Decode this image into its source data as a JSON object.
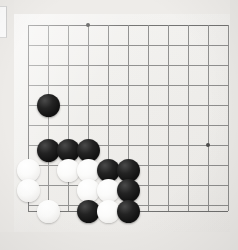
{
  "scene": {
    "title": "Go board corner",
    "subject": "go-game-position",
    "board_color": "#efeeeb",
    "line_color": "#8d8d8c",
    "black_stone_color": "#121212",
    "white_stone_color": "#fbfbfa",
    "background_color": "#eceae6"
  },
  "board": {
    "grid_origin_x": 28,
    "grid_origin_y": 25,
    "grid_spacing": 20,
    "columns": 11,
    "rows": 10,
    "left_edge_x": 28,
    "bottom_edge_y": 211,
    "stone_radius": 11.5,
    "star_points": [
      {
        "x": 88,
        "y": 25
      },
      {
        "x": 208,
        "y": 145
      }
    ],
    "vertical_lines_x": [
      28,
      48,
      68,
      88,
      108,
      128,
      148,
      168,
      188,
      208,
      228
    ],
    "horizontal_lines_y": [
      25,
      45,
      65,
      85,
      105,
      125,
      145,
      165,
      185,
      205,
      211
    ]
  },
  "stones": [
    {
      "color": "black",
      "x": 48,
      "y": 105
    },
    {
      "color": "black",
      "x": 48,
      "y": 150
    },
    {
      "color": "black",
      "x": 68,
      "y": 150
    },
    {
      "color": "black",
      "x": 88,
      "y": 150
    },
    {
      "color": "white",
      "x": 28,
      "y": 170
    },
    {
      "color": "white",
      "x": 68,
      "y": 170
    },
    {
      "color": "white",
      "x": 88,
      "y": 170
    },
    {
      "color": "black",
      "x": 108,
      "y": 170
    },
    {
      "color": "black",
      "x": 128,
      "y": 170
    },
    {
      "color": "white",
      "x": 28,
      "y": 190
    },
    {
      "color": "white",
      "x": 88,
      "y": 190
    },
    {
      "color": "white",
      "x": 108,
      "y": 190
    },
    {
      "color": "black",
      "x": 128,
      "y": 190
    },
    {
      "color": "white",
      "x": 48,
      "y": 211
    },
    {
      "color": "black",
      "x": 88,
      "y": 211
    },
    {
      "color": "white",
      "x": 108,
      "y": 211
    },
    {
      "color": "black",
      "x": 128,
      "y": 211
    }
  ],
  "edge_strip": {
    "label": "page-edge-strip",
    "x": 0,
    "y": 6,
    "width": 6,
    "height": 30
  }
}
